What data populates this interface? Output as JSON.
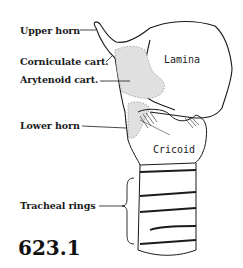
{
  "figure": {
    "number": "623.1"
  },
  "labels": [
    {
      "id": "upper-horn",
      "text": "Upper horn"
    },
    {
      "id": "corniculate",
      "text": "Corniculate cart."
    },
    {
      "id": "arytenoid",
      "text": "Arytenoid cart."
    },
    {
      "id": "lower-horn",
      "text": "Lower horn"
    },
    {
      "id": "tracheal-rings",
      "text": "Tracheal rings"
    }
  ],
  "inline_labels": {
    "lamina": "Lamina",
    "cricoid": "Cricoid"
  },
  "colors": {
    "ink": "#1a1a1a",
    "stipple": "#d9d9d9",
    "background": "#ffffff"
  }
}
